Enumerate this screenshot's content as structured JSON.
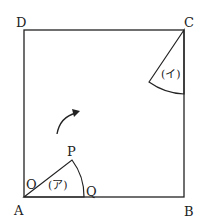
{
  "diagram": {
    "type": "square-with-rotating-sector",
    "vertices": {
      "A": "A",
      "B": "B",
      "C": "C",
      "D": "D"
    },
    "points": {
      "P": "P",
      "Q": "Q",
      "O": "O"
    },
    "sectors": {
      "a": "(ア)",
      "b": "(イ)"
    },
    "rotation_direction": "clockwise",
    "colors": {
      "stroke": "#222222",
      "background": "#ffffff"
    }
  }
}
